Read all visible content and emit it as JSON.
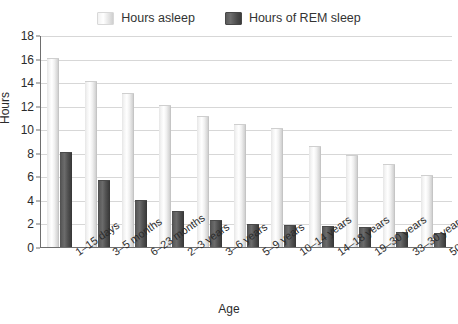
{
  "chart_data": {
    "type": "bar",
    "title": "",
    "xlabel": "Age",
    "ylabel": "Hours",
    "ylim": [
      0,
      18
    ],
    "ytick_step": 2,
    "yticks": [
      18,
      16,
      14,
      12,
      10,
      8,
      6,
      4,
      2,
      0
    ],
    "grid": true,
    "legend_position": "top-center",
    "categories": [
      "1–15 days",
      "3–5 months",
      "6–23 months",
      "2–3 years",
      "3–6 years",
      "5–9 years",
      "10–14 years",
      "14–18 years",
      "19–30 years",
      "33–30 years",
      "50 +"
    ],
    "series": [
      {
        "name": "Hours asleep",
        "color": "#f0f0f0",
        "values": [
          16,
          14,
          13,
          12,
          11,
          10.4,
          10,
          8.5,
          7.7,
          7,
          6
        ]
      },
      {
        "name": "Hours of REM sleep",
        "color": "#4a4a4a",
        "values": [
          8,
          5.6,
          3.9,
          3,
          2.2,
          1.9,
          1.8,
          1.7,
          1.6,
          1.2,
          1.1
        ]
      }
    ]
  },
  "legend": {
    "items": [
      {
        "label": "Hours asleep",
        "swatch": "asleep"
      },
      {
        "label": "Hours of REM sleep",
        "swatch": "rem"
      }
    ]
  },
  "axes": {
    "y_title": "Hours",
    "x_title": "Age"
  }
}
